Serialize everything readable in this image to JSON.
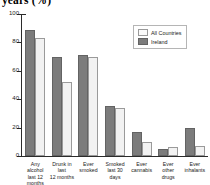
{
  "chart_data": {
    "type": "bar",
    "title": "years (%)",
    "xlabel": "",
    "ylabel": "",
    "ylim": [
      0,
      100
    ],
    "yticks": [
      0,
      20,
      40,
      60,
      80,
      100
    ],
    "grid": false,
    "legend_position": "top-right",
    "categories": [
      "Any alcohol last 12 months",
      "Drunk in last 12 months",
      "Ever smoked",
      "Smoked last 30 days",
      "Ever cannabis",
      "Ever other drugs",
      "Ever inhalants"
    ],
    "category_lines": [
      [
        "Any alcohol",
        "last 12 months"
      ],
      [
        "Drunk in last",
        "12 months"
      ],
      [
        "Ever",
        "smoked"
      ],
      [
        "Smoked",
        "last 30 days"
      ],
      [
        "Ever",
        "cannabis"
      ],
      [
        "Ever",
        "other drugs"
      ],
      [
        "Ever",
        "inhalants"
      ]
    ],
    "series": [
      {
        "name": "All Countries",
        "color": "#f2f2f2",
        "values": [
          83,
          52,
          70,
          34,
          10,
          6,
          7
        ]
      },
      {
        "name": "Ireland",
        "color": "#7c7c7c",
        "values": [
          89,
          70,
          71,
          35,
          17,
          5,
          20
        ]
      }
    ]
  },
  "legend": {
    "items": [
      {
        "label": "All Countries"
      },
      {
        "label": "Ireland"
      }
    ]
  }
}
